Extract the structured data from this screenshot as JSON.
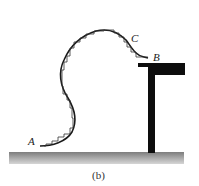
{
  "figure": {
    "caption": "(b)",
    "labels": {
      "A": "A",
      "B": "B",
      "C": "C"
    },
    "colors": {
      "ink": "#1a1a1a",
      "ground_top": "#8a8a8a",
      "ground_bottom": "#d0d0d0",
      "table": "#0d0d0d"
    },
    "elements": [
      "curved-path-A-to-C-to-B",
      "stair-step-approximation",
      "T-shaped-table",
      "ground"
    ]
  }
}
